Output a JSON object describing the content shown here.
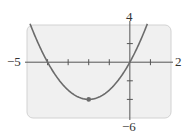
{
  "chart_data": {
    "type": "line",
    "title": "",
    "xlabel": "",
    "ylabel": "",
    "xlim": [
      -5,
      2
    ],
    "ylim": [
      -6,
      4
    ],
    "x_tick_step": 1,
    "y_tick_step": 2,
    "grid": false,
    "window_labels": {
      "xmin": "−5",
      "xmax": "2",
      "ymax": "4",
      "ymin": "−6"
    },
    "series": [
      {
        "name": "y = x^2 + 4x",
        "function": "x^2 + 4x",
        "x": [
          -5.2,
          -5,
          -4,
          -3,
          -2,
          -1,
          0,
          0.8
        ],
        "values": [
          6.24,
          5,
          0,
          -3,
          -4,
          -3,
          0,
          3.84
        ],
        "color": "#6b6b6b"
      }
    ],
    "annotations": [
      {
        "type": "point",
        "x": -2,
        "y": -4,
        "label": "vertex (minimum)"
      }
    ],
    "x_intercepts": [
      -4,
      0
    ],
    "colors": {
      "plot_background": "#f0f0f0",
      "plot_border": "#cfcfcf",
      "axis": "#555555",
      "curve": "#6b6b6b"
    }
  }
}
